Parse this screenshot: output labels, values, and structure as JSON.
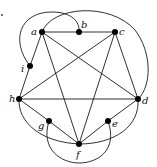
{
  "diagram": {
    "type": "graph",
    "vertices": [
      {
        "id": "a",
        "label": "a",
        "x": 42,
        "y": 32,
        "lx": 31,
        "ly": 35
      },
      {
        "id": "b",
        "label": "b",
        "x": 79,
        "y": 32,
        "lx": 81,
        "ly": 28
      },
      {
        "id": "c",
        "label": "c",
        "x": 115,
        "y": 32,
        "lx": 119,
        "ly": 35
      },
      {
        "id": "i",
        "label": "i",
        "x": 30,
        "y": 66,
        "lx": 21,
        "ly": 72
      },
      {
        "id": "h",
        "label": "h",
        "x": 19,
        "y": 99,
        "lx": 9,
        "ly": 102
      },
      {
        "id": "d",
        "label": "d",
        "x": 138,
        "y": 99,
        "lx": 142,
        "ly": 104
      },
      {
        "id": "g",
        "label": "g",
        "x": 49,
        "y": 121,
        "lx": 38,
        "ly": 129
      },
      {
        "id": "e",
        "label": "e",
        "x": 108,
        "y": 121,
        "lx": 112,
        "ly": 127
      },
      {
        "id": "f",
        "label": "f",
        "x": 79,
        "y": 144,
        "lx": 76,
        "ly": 158
      }
    ],
    "edges": [
      [
        "a",
        "b"
      ],
      [
        "b",
        "c"
      ],
      [
        "a",
        "i"
      ],
      [
        "i",
        "h"
      ],
      [
        "a",
        "f"
      ],
      [
        "a",
        "d"
      ],
      [
        "c",
        "h"
      ],
      [
        "c",
        "f"
      ],
      [
        "c",
        "d"
      ],
      [
        "h",
        "d"
      ],
      [
        "h",
        "g"
      ],
      [
        "g",
        "f"
      ],
      [
        "f",
        "e"
      ],
      [
        "e",
        "d"
      ]
    ],
    "curved_edges": [
      {
        "from": "i",
        "to": "b",
        "path": "M30,66 C10,40 20,12 52,12 C72,12 80,22 79,32"
      },
      {
        "from": "a",
        "to": "d",
        "path": "M42,32 C52,6 110,2 135,30 C152,52 152,86 138,99"
      },
      {
        "from": "h",
        "to": "f",
        "path": "M19,99 C18,122 40,142 79,144"
      },
      {
        "from": "f",
        "to": "d",
        "path": "M79,144 C115,144 140,126 138,99"
      },
      {
        "from": "g",
        "to": "e",
        "path": "M49,121 C40,150 62,163 79,163 C98,163 118,150 108,121"
      }
    ],
    "stray_mark": {
      "x": 2,
      "y": 15
    }
  }
}
